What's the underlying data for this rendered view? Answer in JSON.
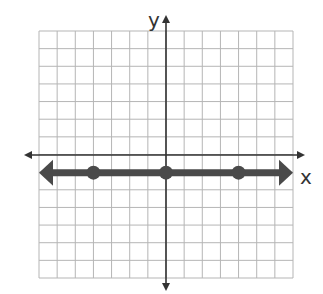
{
  "chart_data": {
    "type": "line",
    "title": "",
    "xlabel": "x",
    "ylabel": "y",
    "xlim": [
      -7,
      7
    ],
    "ylim": [
      -7,
      7
    ],
    "grid": true,
    "series": [
      {
        "name": "y = -1",
        "points": [
          [
            -4,
            -1
          ],
          [
            0,
            -1
          ],
          [
            4,
            -1
          ]
        ],
        "style": "thick line with arrows both ends"
      }
    ]
  },
  "axes": {
    "x_label": "x",
    "y_label": "y"
  },
  "colors": {
    "grid": "#b5b5b5",
    "axis": "#333333",
    "line": "#4a4a4a"
  }
}
